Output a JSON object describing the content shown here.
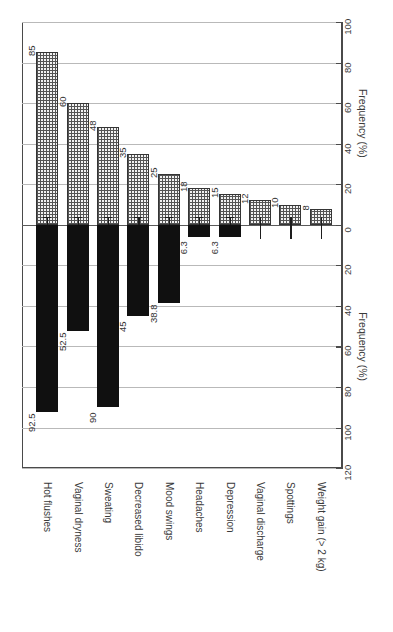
{
  "chart_data": {
    "type": "bar",
    "orientation": "rotated-90",
    "title": "",
    "xlabel": "",
    "ylabel": "Frequency (%)",
    "axis_title_upper": "Frequency (%)",
    "axis_title_lower": "Frequency (%)",
    "categories": [
      "Hot flushes",
      "Vaginal dryness",
      "Sweating",
      "Decreased libido",
      "Mood swings",
      "Headaches",
      "Depression",
      "Vaginal discharge",
      "Spottings",
      "Weight gain (> 2 kg)"
    ],
    "series": [
      {
        "name": "upper",
        "fill": "stippled",
        "values": [
          85,
          60,
          48,
          35,
          25,
          18,
          15,
          12,
          10,
          8
        ],
        "labels": [
          "85",
          "60",
          "48",
          "35",
          "25",
          "18",
          "15",
          "12",
          "10",
          "8"
        ]
      },
      {
        "name": "lower",
        "fill": "solid-black",
        "values": [
          92.5,
          52.5,
          90,
          45,
          38.8,
          6.3,
          6.3,
          0,
          0,
          0
        ],
        "labels": [
          "92.5",
          "52.5",
          "90",
          "45",
          "38.8",
          "6.3",
          "6.3",
          "",
          "",
          ""
        ]
      }
    ],
    "upper_axis_ticks": [
      0,
      20,
      40,
      60,
      80,
      100
    ],
    "lower_axis_ticks": [
      0,
      20,
      40,
      60,
      80,
      100,
      120
    ],
    "upper_axis_tick_labels": [
      "0",
      "20",
      "40",
      "60",
      "80",
      "100"
    ],
    "lower_axis_tick_labels": [
      "0",
      "20",
      "40",
      "60",
      "80",
      "100",
      "120"
    ],
    "ylim_upper": 100,
    "ylim_lower": 120,
    "grid": true,
    "legend": "none",
    "colors": {
      "upper_bar_fill": "#f2f2f2",
      "upper_bar_pattern": "#545454",
      "lower_bar_fill": "#101010",
      "axis": "#4a4a4a",
      "gridline": "#b9b9b9",
      "text": "#3a3a3a"
    }
  }
}
